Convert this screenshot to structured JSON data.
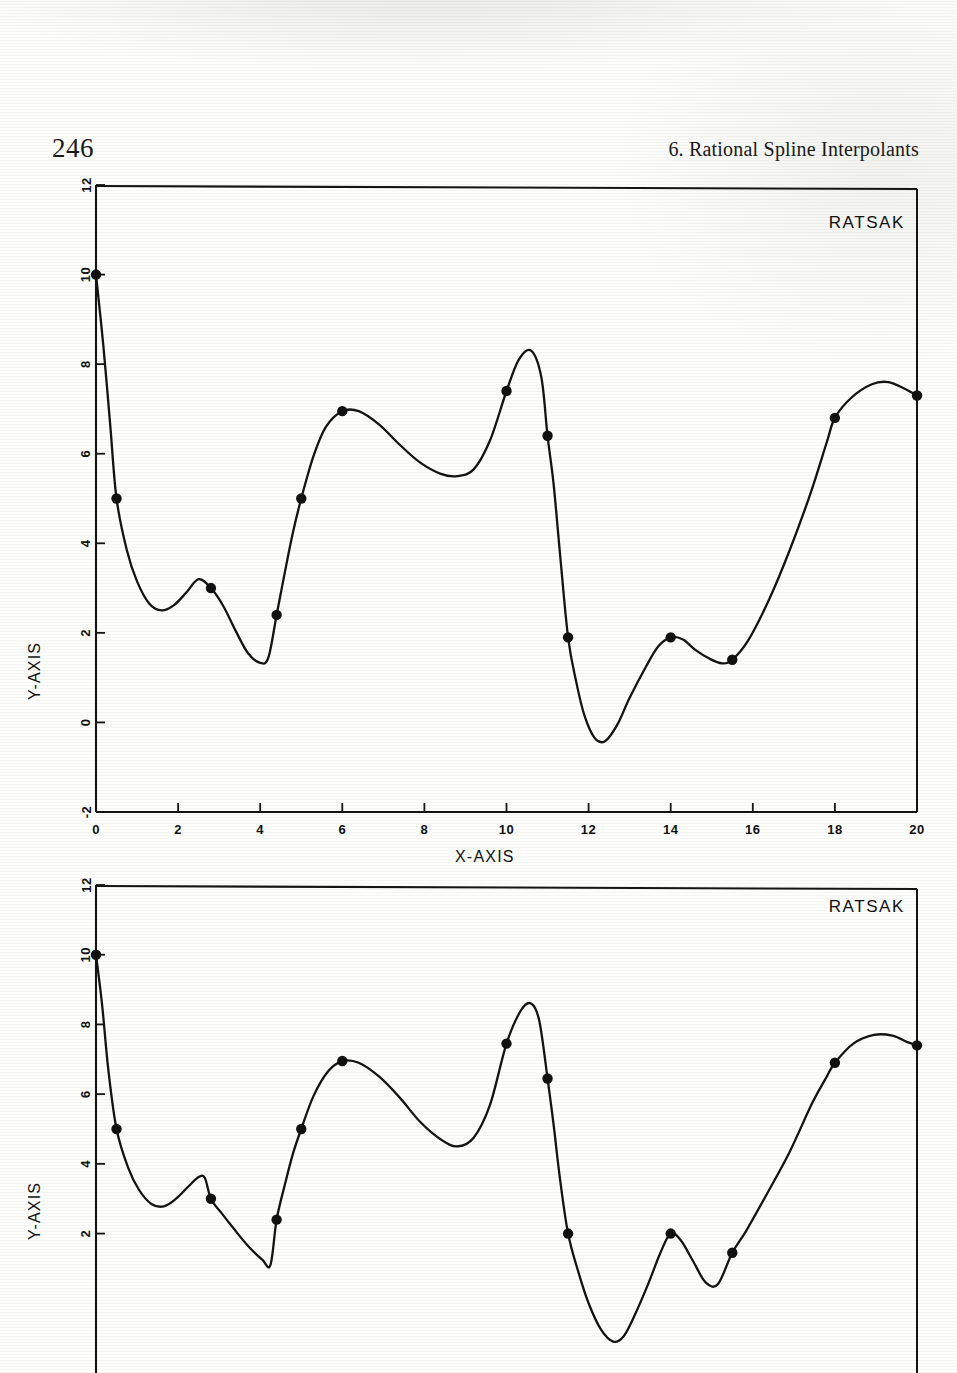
{
  "page": {
    "folio": "246",
    "running_head": "6.   Rational Spline Interpolants"
  },
  "chart_data": [
    {
      "type": "line",
      "title": "RATSAK",
      "xlabel": "X-AXIS",
      "ylabel": "Y-AXIS",
      "xlim": [
        0,
        20
      ],
      "ylim": [
        -2,
        12
      ],
      "xticks": [
        0,
        2,
        4,
        6,
        8,
        10,
        12,
        14,
        16,
        18,
        20
      ],
      "yticks": [
        -2,
        0,
        2,
        4,
        6,
        8,
        10,
        12
      ],
      "grid": false,
      "legend": "none",
      "markers": true,
      "knots_x": [
        0.0,
        0.5,
        2.8,
        4.4,
        5.0,
        6.0,
        10.0,
        11.0,
        11.5,
        14.0,
        15.5,
        18.0,
        20.0
      ],
      "knots_y": [
        10.0,
        5.0,
        3.0,
        2.4,
        5.0,
        6.95,
        7.4,
        6.4,
        1.9,
        1.9,
        1.4,
        6.8,
        7.3
      ],
      "curve": [
        [
          0.0,
          10.0
        ],
        [
          0.18,
          8.4
        ],
        [
          0.35,
          6.6
        ],
        [
          0.5,
          5.0
        ],
        [
          0.75,
          3.85
        ],
        [
          1.0,
          3.15
        ],
        [
          1.3,
          2.65
        ],
        [
          1.6,
          2.5
        ],
        [
          1.9,
          2.62
        ],
        [
          2.2,
          2.9
        ],
        [
          2.5,
          3.2
        ],
        [
          2.8,
          3.0
        ],
        [
          3.1,
          2.6
        ],
        [
          3.4,
          2.05
        ],
        [
          3.7,
          1.55
        ],
        [
          4.0,
          1.33
        ],
        [
          4.2,
          1.45
        ],
        [
          4.4,
          2.4
        ],
        [
          4.6,
          3.35
        ],
        [
          4.8,
          4.25
        ],
        [
          5.0,
          5.0
        ],
        [
          5.3,
          5.95
        ],
        [
          5.6,
          6.6
        ],
        [
          6.0,
          6.95
        ],
        [
          6.4,
          6.95
        ],
        [
          6.9,
          6.65
        ],
        [
          7.4,
          6.2
        ],
        [
          7.9,
          5.8
        ],
        [
          8.4,
          5.55
        ],
        [
          8.8,
          5.5
        ],
        [
          9.2,
          5.65
        ],
        [
          9.6,
          6.3
        ],
        [
          10.0,
          7.4
        ],
        [
          10.3,
          8.1
        ],
        [
          10.6,
          8.3
        ],
        [
          10.85,
          7.7
        ],
        [
          11.0,
          6.4
        ],
        [
          11.15,
          5.3
        ],
        [
          11.3,
          3.8
        ],
        [
          11.5,
          1.9
        ],
        [
          11.7,
          0.9
        ],
        [
          11.9,
          0.15
        ],
        [
          12.15,
          -0.35
        ],
        [
          12.4,
          -0.42
        ],
        [
          12.7,
          -0.05
        ],
        [
          13.0,
          0.55
        ],
        [
          13.4,
          1.25
        ],
        [
          13.7,
          1.7
        ],
        [
          14.0,
          1.9
        ],
        [
          14.3,
          1.85
        ],
        [
          14.6,
          1.62
        ],
        [
          14.95,
          1.42
        ],
        [
          15.25,
          1.32
        ],
        [
          15.5,
          1.4
        ],
        [
          15.9,
          1.85
        ],
        [
          16.4,
          2.75
        ],
        [
          16.9,
          3.85
        ],
        [
          17.4,
          5.1
        ],
        [
          17.8,
          6.25
        ],
        [
          18.0,
          6.8
        ],
        [
          18.4,
          7.25
        ],
        [
          18.9,
          7.55
        ],
        [
          19.3,
          7.6
        ],
        [
          19.7,
          7.45
        ],
        [
          20.0,
          7.3
        ]
      ]
    },
    {
      "type": "line",
      "title": "RATSAK",
      "xlabel": "X-AXIS",
      "ylabel": "Y-AXIS",
      "xlim": [
        0,
        20
      ],
      "ylim": [
        -2,
        12
      ],
      "xticks": [
        0,
        2,
        4,
        6,
        8,
        10,
        12,
        14,
        16,
        18,
        20
      ],
      "yticks": [
        2,
        4,
        6,
        8,
        10,
        12
      ],
      "grid": false,
      "legend": "none",
      "markers": true,
      "knots_x": [
        0.0,
        0.5,
        2.8,
        4.4,
        5.0,
        6.0,
        10.0,
        11.0,
        11.5,
        14.0,
        15.5,
        18.0,
        20.0
      ],
      "knots_y": [
        10.0,
        5.0,
        3.0,
        2.4,
        5.0,
        6.95,
        7.45,
        6.45,
        2.0,
        2.0,
        1.45,
        6.9,
        7.4
      ],
      "curve": [
        [
          0.0,
          10.0
        ],
        [
          0.15,
          8.55
        ],
        [
          0.3,
          6.7
        ],
        [
          0.5,
          5.0
        ],
        [
          0.78,
          3.9
        ],
        [
          1.05,
          3.25
        ],
        [
          1.35,
          2.85
        ],
        [
          1.65,
          2.78
        ],
        [
          1.95,
          3.0
        ],
        [
          2.25,
          3.35
        ],
        [
          2.5,
          3.62
        ],
        [
          2.65,
          3.6
        ],
        [
          2.8,
          3.0
        ],
        [
          3.05,
          2.6
        ],
        [
          3.35,
          2.15
        ],
        [
          3.7,
          1.65
        ],
        [
          4.05,
          1.25
        ],
        [
          4.25,
          1.1
        ],
        [
          4.4,
          2.4
        ],
        [
          4.6,
          3.4
        ],
        [
          4.8,
          4.3
        ],
        [
          5.0,
          5.0
        ],
        [
          5.3,
          5.95
        ],
        [
          5.65,
          6.65
        ],
        [
          6.0,
          6.95
        ],
        [
          6.4,
          6.9
        ],
        [
          6.9,
          6.5
        ],
        [
          7.4,
          5.9
        ],
        [
          7.9,
          5.2
        ],
        [
          8.4,
          4.7
        ],
        [
          8.8,
          4.5
        ],
        [
          9.2,
          4.75
        ],
        [
          9.6,
          5.7
        ],
        [
          10.0,
          7.45
        ],
        [
          10.35,
          8.4
        ],
        [
          10.6,
          8.6
        ],
        [
          10.8,
          8.1
        ],
        [
          11.0,
          6.45
        ],
        [
          11.15,
          5.1
        ],
        [
          11.3,
          3.6
        ],
        [
          11.5,
          2.0
        ],
        [
          11.75,
          0.9
        ],
        [
          12.0,
          0.0
        ],
        [
          12.3,
          -0.75
        ],
        [
          12.6,
          -1.1
        ],
        [
          12.85,
          -0.95
        ],
        [
          13.1,
          -0.4
        ],
        [
          13.45,
          0.55
        ],
        [
          13.75,
          1.45
        ],
        [
          14.0,
          2.0
        ],
        [
          14.25,
          1.8
        ],
        [
          14.55,
          1.2
        ],
        [
          14.85,
          0.6
        ],
        [
          15.15,
          0.55
        ],
        [
          15.5,
          1.45
        ],
        [
          15.85,
          2.1
        ],
        [
          16.35,
          3.15
        ],
        [
          16.9,
          4.35
        ],
        [
          17.45,
          5.75
        ],
        [
          17.8,
          6.5
        ],
        [
          18.0,
          6.9
        ],
        [
          18.45,
          7.45
        ],
        [
          18.95,
          7.7
        ],
        [
          19.4,
          7.68
        ],
        [
          19.75,
          7.5
        ],
        [
          20.0,
          7.4
        ]
      ]
    }
  ]
}
